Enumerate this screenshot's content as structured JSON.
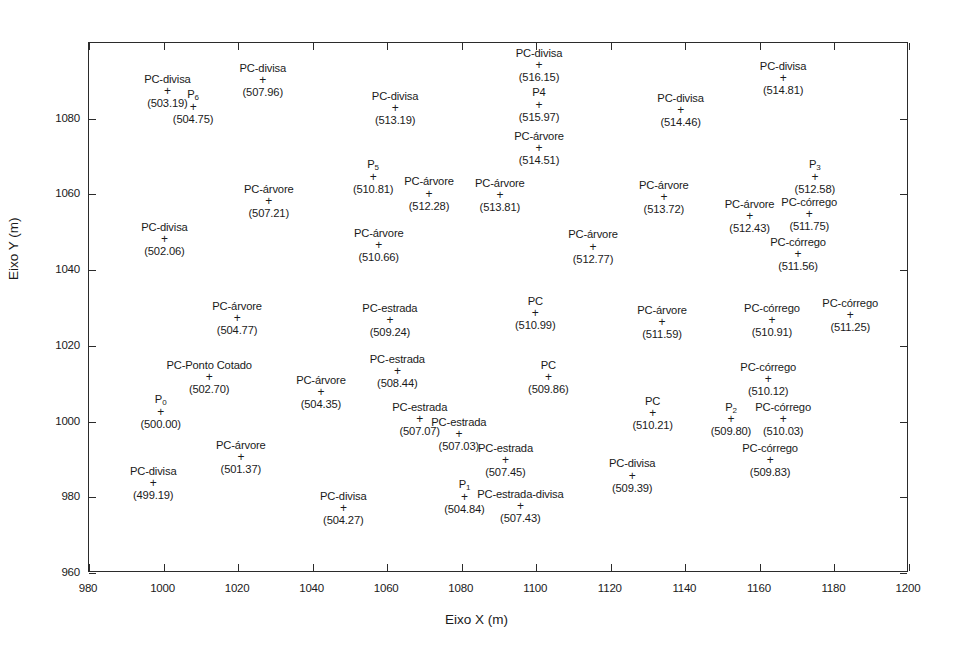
{
  "chart_data": {
    "type": "scatter",
    "title": "",
    "xlabel": "Eixo X (m)",
    "ylabel": "Eixo Y (m)",
    "xlim": [
      980,
      1200
    ],
    "ylim": [
      960,
      1100
    ],
    "xticks": [
      980,
      1000,
      1020,
      1040,
      1060,
      1080,
      1100,
      1120,
      1140,
      1160,
      1180,
      1200
    ],
    "yticks": [
      960,
      980,
      1000,
      1020,
      1040,
      1060,
      1080
    ],
    "xtick_labels": [
      "980",
      "1000",
      "1020",
      "1040",
      "1060",
      "1080",
      "1100",
      "1120",
      "1140",
      "1160",
      "1180",
      "1200"
    ],
    "ytick_labels": [
      "960",
      "980",
      "1000",
      "1020",
      "1040",
      "1060",
      "1080"
    ],
    "grid": false,
    "legend": false,
    "marker": "+",
    "point_color": "#1a1a1a",
    "points": [
      {
        "label": "PC-divisa",
        "sub": "",
        "value": "(503.19)",
        "x": 1001.3,
        "y": 1087.0
      },
      {
        "label": "P",
        "sub": "6",
        "value": "(504.75)",
        "x": 1008.2,
        "y": 1083.0
      },
      {
        "label": "PC-divisa",
        "sub": "",
        "value": "(507.96)",
        "x": 1026.9,
        "y": 1090.0
      },
      {
        "label": "PC-divisa",
        "sub": "",
        "value": "(513.19)",
        "x": 1062.4,
        "y": 1082.5
      },
      {
        "label": "PC-divisa",
        "sub": "",
        "value": "(516.15)",
        "x": 1101.0,
        "y": 1094.0
      },
      {
        "label": "P4",
        "sub": "",
        "value": "(515.97)",
        "x": 1101.0,
        "y": 1083.5
      },
      {
        "label": "PC-árvore",
        "sub": "",
        "value": "(514.51)",
        "x": 1101.0,
        "y": 1072.0
      },
      {
        "label": "PC-divisa",
        "sub": "",
        "value": "(514.46)",
        "x": 1139.0,
        "y": 1082.0
      },
      {
        "label": "PC-divisa",
        "sub": "",
        "value": "(514.81)",
        "x": 1166.5,
        "y": 1090.5
      },
      {
        "label": "P",
        "sub": "5",
        "value": "(510.81)",
        "x": 1056.5,
        "y": 1064.5
      },
      {
        "label": "PC-árvore",
        "sub": "",
        "value": "(512.28)",
        "x": 1071.5,
        "y": 1060.0
      },
      {
        "label": "PC-árvore",
        "sub": "",
        "value": "(513.81)",
        "x": 1090.5,
        "y": 1059.5
      },
      {
        "label": "PC-árvore",
        "sub": "",
        "value": "(513.72)",
        "x": 1134.5,
        "y": 1059.0
      },
      {
        "label": "P",
        "sub": "3",
        "value": "(512.58)",
        "x": 1175.0,
        "y": 1064.5
      },
      {
        "label": "PC-árvore",
        "sub": "",
        "value": "(507.21)",
        "x": 1028.5,
        "y": 1058.0
      },
      {
        "label": "PC-divisa",
        "sub": "",
        "value": "(502.06)",
        "x": 1000.5,
        "y": 1048.0
      },
      {
        "label": "PC-árvore",
        "sub": "",
        "value": "(512.43)",
        "x": 1157.5,
        "y": 1054.0
      },
      {
        "label": "PC-córrego",
        "sub": "",
        "value": "(511.75)",
        "x": 1173.5,
        "y": 1054.5
      },
      {
        "label": "PC-árvore",
        "sub": "",
        "value": "(510.66)",
        "x": 1058.0,
        "y": 1046.5
      },
      {
        "label": "PC-árvore",
        "sub": "",
        "value": "(512.77)",
        "x": 1115.5,
        "y": 1046.0
      },
      {
        "label": "PC-córrego",
        "sub": "",
        "value": "(511.56)",
        "x": 1170.5,
        "y": 1044.0
      },
      {
        "label": "PC",
        "sub": "",
        "value": "(510.99)",
        "x": 1100.0,
        "y": 1028.5
      },
      {
        "label": "PC-árvore",
        "sub": "",
        "value": "(504.77)",
        "x": 1020.0,
        "y": 1027.0
      },
      {
        "label": "PC-árvore",
        "sub": "",
        "value": "(511.59)",
        "x": 1134.0,
        "y": 1026.0
      },
      {
        "label": "PC-córrego",
        "sub": "",
        "value": "(510.91)",
        "x": 1163.5,
        "y": 1026.5
      },
      {
        "label": "PC-córrego",
        "sub": "",
        "value": "(511.25)",
        "x": 1184.5,
        "y": 1028.0
      },
      {
        "label": "PC-estrada",
        "sub": "",
        "value": "(509.24)",
        "x": 1061.0,
        "y": 1026.5
      },
      {
        "label": "PC-Ponto Cotado",
        "sub": "",
        "value": "(502.70)",
        "x": 1012.5,
        "y": 1011.5
      },
      {
        "label": "PC-estrada",
        "sub": "",
        "value": "(508.44)",
        "x": 1063.0,
        "y": 1013.0
      },
      {
        "label": "PC",
        "sub": "",
        "value": "(509.86)",
        "x": 1103.5,
        "y": 1011.5
      },
      {
        "label": "PC-córrego",
        "sub": "",
        "value": "(510.12)",
        "x": 1162.5,
        "y": 1011.0
      },
      {
        "label": "PC-árvore",
        "sub": "",
        "value": "(504.35)",
        "x": 1042.5,
        "y": 1007.5
      },
      {
        "label": "P",
        "sub": "0",
        "value": "(500.00)",
        "x": 999.5,
        "y": 1002.5
      },
      {
        "label": "PC-estrada",
        "sub": "",
        "value": "(507.07)",
        "x": 1069.0,
        "y": 1000.5
      },
      {
        "label": "PC",
        "sub": "",
        "value": "(510.21)",
        "x": 1131.5,
        "y": 1002.0
      },
      {
        "label": "P",
        "sub": "2",
        "value": "(509.80)",
        "x": 1152.5,
        "y": 1000.5
      },
      {
        "label": "PC-córrego",
        "sub": "",
        "value": "(510.03)",
        "x": 1166.5,
        "y": 1000.5
      },
      {
        "label": "PC-estrada",
        "sub": "",
        "value": "(507.03)",
        "x": 1079.5,
        "y": 996.5
      },
      {
        "label": "PC-árvore",
        "sub": "",
        "value": "(501.37)",
        "x": 1021.0,
        "y": 990.5
      },
      {
        "label": "PC-estrada",
        "sub": "",
        "value": "(507.45)",
        "x": 1092.0,
        "y": 989.5
      },
      {
        "label": "PC-córrego",
        "sub": "",
        "value": "(509.83)",
        "x": 1163.0,
        "y": 989.5
      },
      {
        "label": "PC-divisa",
        "sub": "",
        "value": "(509.39)",
        "x": 1126.0,
        "y": 985.5
      },
      {
        "label": "PC-divisa",
        "sub": "",
        "value": "(499.19)",
        "x": 997.5,
        "y": 983.5
      },
      {
        "label": "P",
        "sub": "1",
        "value": "(504.84)",
        "x": 1081.0,
        "y": 980.0
      },
      {
        "label": "PC-estrada-divisa",
        "sub": "",
        "value": "(507.43)",
        "x": 1096.0,
        "y": 977.5
      },
      {
        "label": "PC-divisa",
        "sub": "",
        "value": "(504.27)",
        "x": 1048.5,
        "y": 977.0
      }
    ]
  }
}
